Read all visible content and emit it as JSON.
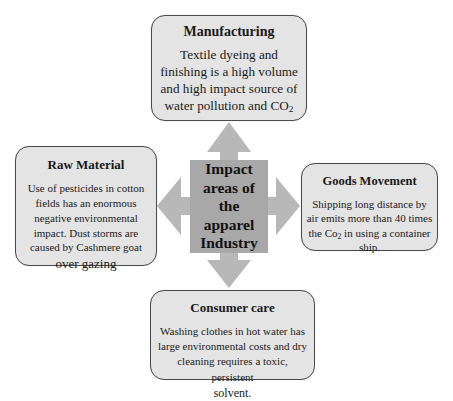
{
  "center": {
    "lines": [
      "Impact",
      "areas of",
      "the",
      "apparel",
      "Industry"
    ]
  },
  "boxes": {
    "manufacturing": {
      "title": "Manufacturing",
      "body_main": "Textile dyeing and finishing is a high volume and high impact source of water pollution and CO",
      "body_sub": "2"
    },
    "raw_material": {
      "title": "Raw Material",
      "body_main": "Use of pesticides in cotton fields has an enormous negative environmental impact. Dust storms are caused by Cashmere goat",
      "body_tail": "over gazing"
    },
    "goods_movement": {
      "title": "Goods Movement",
      "body_pre": "Shipping long distance by air emits more than 40 times the Co",
      "body_sub": "2",
      "body_post": " in using a container ship."
    },
    "consumer_care": {
      "title": "Consumer care",
      "body_main": "Washing clothes in hot water has large environmental costs and dry cleaning requires a toxic, persistent",
      "body_tail": "solvent."
    }
  },
  "colors": {
    "box_fill": "#e4e4e4",
    "box_border": "#4a4a4a",
    "arrow_fill": "#b8b8b8",
    "center_fill": "#a8a8a8"
  }
}
